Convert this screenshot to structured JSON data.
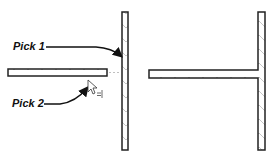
{
  "diagram": {
    "left_panel": {
      "labels": {
        "pick1": "Pick 1",
        "pick2": "Pick 2"
      },
      "cursor_hint": "=|"
    },
    "right_panel": {
      "description": "T-junction result"
    },
    "colors": {
      "wall_outline": "#222222",
      "wall_hatch": "#b0b0b0",
      "arrow": "#111111",
      "dotted_guide": "#c0c0c0"
    }
  }
}
